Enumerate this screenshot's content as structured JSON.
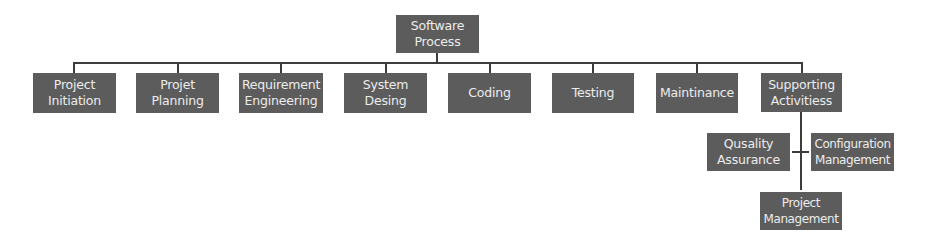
{
  "diagram": {
    "type": "hierarchy",
    "root": {
      "id": "software-process",
      "label": "Software\nProcess"
    },
    "level1": [
      {
        "id": "project-initiation",
        "label": "Project\nInitiation"
      },
      {
        "id": "projet-planning",
        "label": "Projet\nPlanning"
      },
      {
        "id": "requirement-engineering",
        "label": "Requirement\nEngineering"
      },
      {
        "id": "system-desing",
        "label": "System\nDesing"
      },
      {
        "id": "coding",
        "label": "Coding"
      },
      {
        "id": "testing",
        "label": "Testing"
      },
      {
        "id": "maintinance",
        "label": "Maintinance"
      },
      {
        "id": "supporting-activitiess",
        "label": "Supporting\nActivitiess"
      }
    ],
    "supporting_children": [
      {
        "id": "qusality-assurance",
        "label": "Qusality\nAssurance"
      },
      {
        "id": "configuration-management",
        "label": "Configuration\nManagement"
      },
      {
        "id": "project-management",
        "label": "Project\nManagement"
      }
    ],
    "colors": {
      "node_fill": "#5c5c5c",
      "node_text": "#ececec",
      "connector": "#3c3c3c",
      "background": "#ffffff"
    }
  }
}
